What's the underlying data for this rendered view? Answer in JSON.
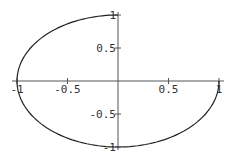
{
  "chart_data": {
    "type": "line",
    "title": "",
    "xlabel": "",
    "ylabel": "",
    "xlim": [
      -1,
      1
    ],
    "ylim": [
      -1,
      1
    ],
    "grid": false,
    "legend": null,
    "x_ticks": [
      {
        "value": -1,
        "label": "-1"
      },
      {
        "value": -0.5,
        "label": "-0.5"
      },
      {
        "value": 0.5,
        "label": "0.5"
      },
      {
        "value": 1,
        "label": "1"
      }
    ],
    "y_ticks": [
      {
        "value": 1,
        "label": "1"
      },
      {
        "value": 0.5,
        "label": "0.5"
      },
      {
        "value": -0.5,
        "label": "-0.5"
      },
      {
        "value": -1,
        "label": "-1"
      }
    ],
    "series": [
      {
        "name": "parametric curve",
        "description": "Open arc from (0,1) counter-clockwise through (-1,0) and (0,-1) ending at (1,0)",
        "points": [
          [
            0,
            1
          ],
          [
            -0.383,
            0.924
          ],
          [
            -0.707,
            0.707
          ],
          [
            -0.924,
            0.383
          ],
          [
            -1,
            0
          ],
          [
            -0.924,
            -0.383
          ],
          [
            -0.707,
            -0.707
          ],
          [
            -0.383,
            -0.924
          ],
          [
            0,
            -1
          ],
          [
            0.383,
            -0.924
          ],
          [
            0.707,
            -0.707
          ],
          [
            0.924,
            -0.383
          ],
          [
            1,
            0
          ]
        ]
      }
    ],
    "colors": {
      "curve": "#222222",
      "axes": "#555555",
      "text": "#333333",
      "background": "#ffffff"
    }
  },
  "layout": {
    "origin_px": [
      118,
      81
    ],
    "x_scale_px": 101,
    "y_scale_px": 66
  }
}
